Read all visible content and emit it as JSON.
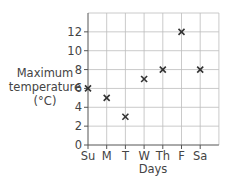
{
  "chart_data": {
    "type": "scatter",
    "title": "",
    "xlabel": "Days",
    "ylabel": "Maximum temperature (°C)",
    "ylabel_lines": [
      "Maximum",
      "temperature",
      "(°C)"
    ],
    "categories": [
      "Su",
      "M",
      "T",
      "W",
      "Th",
      "F",
      "Sa"
    ],
    "values": [
      6,
      5,
      3,
      7,
      8,
      12,
      8
    ],
    "yticks": [
      0,
      2,
      4,
      6,
      8,
      10,
      12
    ],
    "ylim": [
      0,
      14
    ],
    "grid": true,
    "marker": "x",
    "legend": null
  },
  "colors": {
    "grid": "#bdbdbd",
    "axis": "#555555",
    "marker": "#333333",
    "text": "#444444"
  }
}
